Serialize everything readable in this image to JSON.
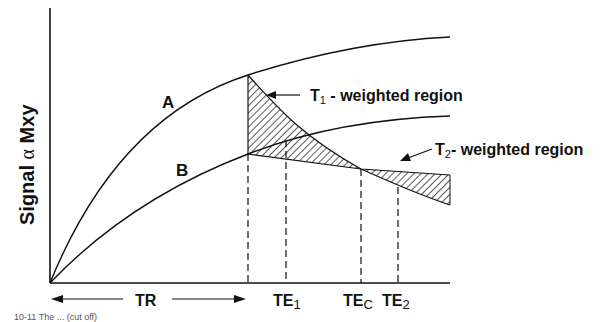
{
  "diagram": {
    "y_axis_label": {
      "prefix": "Signal ",
      "symbol": "α",
      "suffix": " Mxy"
    },
    "curves": [
      {
        "id": "A",
        "label": "A"
      },
      {
        "id": "B",
        "label": "B"
      }
    ],
    "x_labels": {
      "tr": "TR",
      "te1": {
        "main": "TE",
        "sub": "1"
      },
      "tec": {
        "main": "TE",
        "sub": "C"
      },
      "te2": {
        "main": "TE",
        "sub": "2"
      }
    },
    "regions": {
      "t1": {
        "main": "T",
        "sub": "1",
        "rest": " - weighted region"
      },
      "t2": {
        "main": "T",
        "sub": "2",
        "rest": "- weighted region"
      }
    },
    "caption": "10-11  The ... (cut off)",
    "colors": {
      "ink": "#111111",
      "background": "#ffffff"
    }
  }
}
